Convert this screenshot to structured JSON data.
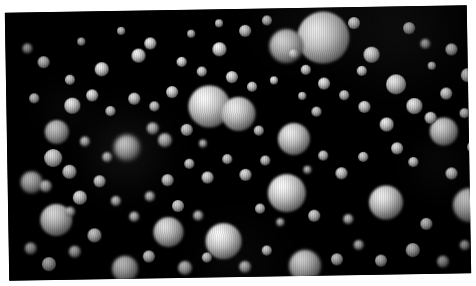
{
  "meta": {
    "domain": "Natural-Image"
  },
  "canvas": {
    "width": 476,
    "height": 286,
    "page_background": "#ffffff",
    "plate_background": "#000000",
    "plate_rotation_deg": -0.95,
    "plate_width": 462,
    "plate_height": 268
  },
  "palette": {
    "background": "#000000",
    "page": "#ffffff",
    "sphere_highlight": "#ffffff",
    "sphere_midtone": "#d9d9d9",
    "sphere_shadow": "#3a3a3a",
    "sphere_terminator": "#141414",
    "haze": "#4a4a4a"
  },
  "lighting": {
    "highlight_x_pct": 36,
    "highlight_y_pct": 30,
    "model": "radial-gradient"
  },
  "glows": [
    {
      "x": 118,
      "y": 140,
      "r": 46,
      "a": 0.17
    },
    {
      "x": 392,
      "y": 14,
      "r": 72,
      "a": 0.16
    },
    {
      "x": 300,
      "y": 6,
      "r": 52,
      "a": 0.1
    },
    {
      "x": 230,
      "y": 250,
      "r": 46,
      "a": 0.08
    },
    {
      "x": 58,
      "y": 96,
      "r": 30,
      "a": 0.07
    },
    {
      "x": 430,
      "y": 160,
      "r": 34,
      "a": 0.07
    }
  ],
  "spheres": [
    {
      "x": 318,
      "y": 30,
      "r": 26,
      "b": 0.3,
      "i": 1.0
    },
    {
      "x": 281,
      "y": 38,
      "r": 17,
      "b": 0.8,
      "i": 0.85
    },
    {
      "x": 203,
      "y": 97,
      "r": 21,
      "b": 0.4,
      "i": 1.0
    },
    {
      "x": 232,
      "y": 105,
      "r": 17,
      "b": 0.5,
      "i": 0.95
    },
    {
      "x": 287,
      "y": 131,
      "r": 16,
      "b": 0.6,
      "i": 0.95
    },
    {
      "x": 279,
      "y": 185,
      "r": 19,
      "b": 0.4,
      "i": 1.0
    },
    {
      "x": 215,
      "y": 232,
      "r": 18,
      "b": 0.5,
      "i": 1.0
    },
    {
      "x": 160,
      "y": 222,
      "r": 15,
      "b": 0.7,
      "i": 0.9
    },
    {
      "x": 378,
      "y": 196,
      "r": 17,
      "b": 0.5,
      "i": 0.95
    },
    {
      "x": 48,
      "y": 208,
      "r": 16,
      "b": 0.6,
      "i": 0.95
    },
    {
      "x": 50,
      "y": 120,
      "r": 12,
      "b": 0.9,
      "i": 0.8
    },
    {
      "x": 120,
      "y": 137,
      "r": 13,
      "b": 1.2,
      "i": 0.8
    },
    {
      "x": 296,
      "y": 258,
      "r": 16,
      "b": 0.8,
      "i": 0.9
    },
    {
      "x": 116,
      "y": 258,
      "r": 13,
      "b": 1.0,
      "i": 0.85
    },
    {
      "x": 437,
      "y": 126,
      "r": 14,
      "b": 0.7,
      "i": 0.9
    },
    {
      "x": 462,
      "y": 200,
      "r": 17,
      "b": 0.8,
      "i": 0.9
    },
    {
      "x": 390,
      "y": 78,
      "r": 10,
      "b": 0.6,
      "i": 0.95
    },
    {
      "x": 24,
      "y": 170,
      "r": 11,
      "b": 1.1,
      "i": 0.8
    },
    {
      "x": 66,
      "y": 94,
      "r": 8,
      "b": 0.6,
      "i": 0.95
    },
    {
      "x": 96,
      "y": 58,
      "r": 7,
      "b": 0.5,
      "i": 1.0
    },
    {
      "x": 133,
      "y": 45,
      "r": 7,
      "b": 0.5,
      "i": 1.0
    },
    {
      "x": 145,
      "y": 33,
      "r": 6,
      "b": 0.5,
      "i": 1.0
    },
    {
      "x": 176,
      "y": 52,
      "r": 5,
      "b": 0.6,
      "i": 0.95
    },
    {
      "x": 214,
      "y": 40,
      "r": 7,
      "b": 0.5,
      "i": 1.0
    },
    {
      "x": 240,
      "y": 22,
      "r": 6,
      "b": 0.7,
      "i": 0.9
    },
    {
      "x": 262,
      "y": 12,
      "r": 5,
      "b": 0.8,
      "i": 0.85
    },
    {
      "x": 349,
      "y": 16,
      "r": 6,
      "b": 0.6,
      "i": 0.95
    },
    {
      "x": 366,
      "y": 48,
      "r": 8,
      "b": 0.6,
      "i": 0.95
    },
    {
      "x": 404,
      "y": 22,
      "r": 6,
      "b": 0.8,
      "i": 0.85
    },
    {
      "x": 420,
      "y": 38,
      "r": 5,
      "b": 0.9,
      "i": 0.8
    },
    {
      "x": 446,
      "y": 44,
      "r": 6,
      "b": 0.7,
      "i": 0.9
    },
    {
      "x": 462,
      "y": 70,
      "r": 7,
      "b": 0.7,
      "i": 0.9
    },
    {
      "x": 440,
      "y": 88,
      "r": 6,
      "b": 0.6,
      "i": 0.95
    },
    {
      "x": 408,
      "y": 100,
      "r": 8,
      "b": 0.6,
      "i": 0.95
    },
    {
      "x": 424,
      "y": 112,
      "r": 6,
      "b": 0.7,
      "i": 0.9
    },
    {
      "x": 380,
      "y": 118,
      "r": 7,
      "b": 0.6,
      "i": 0.95
    },
    {
      "x": 358,
      "y": 100,
      "r": 6,
      "b": 0.7,
      "i": 0.9
    },
    {
      "x": 338,
      "y": 88,
      "r": 5,
      "b": 0.8,
      "i": 0.85
    },
    {
      "x": 318,
      "y": 76,
      "r": 6,
      "b": 0.6,
      "i": 0.95
    },
    {
      "x": 300,
      "y": 62,
      "r": 5,
      "b": 0.7,
      "i": 0.9
    },
    {
      "x": 268,
      "y": 72,
      "r": 4,
      "b": 0.6,
      "i": 0.95
    },
    {
      "x": 246,
      "y": 78,
      "r": 5,
      "b": 0.7,
      "i": 0.9
    },
    {
      "x": 226,
      "y": 68,
      "r": 6,
      "b": 0.6,
      "i": 0.95
    },
    {
      "x": 196,
      "y": 62,
      "r": 5,
      "b": 0.7,
      "i": 0.9
    },
    {
      "x": 166,
      "y": 82,
      "r": 6,
      "b": 0.6,
      "i": 0.95
    },
    {
      "x": 148,
      "y": 96,
      "r": 5,
      "b": 0.8,
      "i": 0.85
    },
    {
      "x": 128,
      "y": 88,
      "r": 6,
      "b": 0.7,
      "i": 0.9
    },
    {
      "x": 104,
      "y": 100,
      "r": 5,
      "b": 0.8,
      "i": 0.85
    },
    {
      "x": 86,
      "y": 84,
      "r": 6,
      "b": 0.6,
      "i": 0.95
    },
    {
      "x": 64,
      "y": 68,
      "r": 5,
      "b": 0.7,
      "i": 0.9
    },
    {
      "x": 38,
      "y": 50,
      "r": 6,
      "b": 0.7,
      "i": 0.9
    },
    {
      "x": 22,
      "y": 36,
      "r": 5,
      "b": 0.9,
      "i": 0.8
    },
    {
      "x": 28,
      "y": 86,
      "r": 5,
      "b": 0.8,
      "i": 0.85
    },
    {
      "x": 46,
      "y": 146,
      "r": 9,
      "b": 0.7,
      "i": 0.9
    },
    {
      "x": 62,
      "y": 160,
      "r": 7,
      "b": 0.8,
      "i": 0.85
    },
    {
      "x": 38,
      "y": 174,
      "r": 6,
      "b": 0.9,
      "i": 0.8
    },
    {
      "x": 72,
      "y": 186,
      "r": 7,
      "b": 0.7,
      "i": 0.9
    },
    {
      "x": 92,
      "y": 170,
      "r": 6,
      "b": 0.8,
      "i": 0.85
    },
    {
      "x": 108,
      "y": 190,
      "r": 5,
      "b": 0.9,
      "i": 0.8
    },
    {
      "x": 86,
      "y": 224,
      "r": 7,
      "b": 0.8,
      "i": 0.85
    },
    {
      "x": 66,
      "y": 240,
      "r": 6,
      "b": 0.9,
      "i": 0.8
    },
    {
      "x": 40,
      "y": 252,
      "r": 7,
      "b": 0.8,
      "i": 0.85
    },
    {
      "x": 22,
      "y": 236,
      "r": 6,
      "b": 1.0,
      "i": 0.8
    },
    {
      "x": 140,
      "y": 246,
      "r": 6,
      "b": 0.8,
      "i": 0.85
    },
    {
      "x": 176,
      "y": 258,
      "r": 7,
      "b": 0.9,
      "i": 0.8
    },
    {
      "x": 198,
      "y": 248,
      "r": 5,
      "b": 0.8,
      "i": 0.85
    },
    {
      "x": 236,
      "y": 258,
      "r": 6,
      "b": 0.9,
      "i": 0.8
    },
    {
      "x": 258,
      "y": 242,
      "r": 5,
      "b": 0.8,
      "i": 0.85
    },
    {
      "x": 328,
      "y": 252,
      "r": 6,
      "b": 0.8,
      "i": 0.85
    },
    {
      "x": 350,
      "y": 238,
      "r": 5,
      "b": 0.9,
      "i": 0.8
    },
    {
      "x": 372,
      "y": 254,
      "r": 6,
      "b": 0.8,
      "i": 0.85
    },
    {
      "x": 404,
      "y": 244,
      "r": 7,
      "b": 0.8,
      "i": 0.85
    },
    {
      "x": 434,
      "y": 256,
      "r": 6,
      "b": 0.9,
      "i": 0.8
    },
    {
      "x": 456,
      "y": 240,
      "r": 5,
      "b": 1.0,
      "i": 0.8
    },
    {
      "x": 418,
      "y": 218,
      "r": 6,
      "b": 0.8,
      "i": 0.85
    },
    {
      "x": 444,
      "y": 168,
      "r": 6,
      "b": 0.7,
      "i": 0.9
    },
    {
      "x": 406,
      "y": 156,
      "r": 5,
      "b": 0.8,
      "i": 0.85
    },
    {
      "x": 390,
      "y": 142,
      "r": 6,
      "b": 0.7,
      "i": 0.9
    },
    {
      "x": 356,
      "y": 150,
      "r": 5,
      "b": 0.8,
      "i": 0.85
    },
    {
      "x": 334,
      "y": 166,
      "r": 6,
      "b": 0.7,
      "i": 0.9
    },
    {
      "x": 316,
      "y": 148,
      "r": 5,
      "b": 0.8,
      "i": 0.85
    },
    {
      "x": 300,
      "y": 162,
      "r": 4,
      "b": 0.9,
      "i": 0.8
    },
    {
      "x": 258,
      "y": 152,
      "r": 5,
      "b": 0.8,
      "i": 0.85
    },
    {
      "x": 238,
      "y": 166,
      "r": 6,
      "b": 0.7,
      "i": 0.9
    },
    {
      "x": 220,
      "y": 150,
      "r": 5,
      "b": 0.8,
      "i": 0.85
    },
    {
      "x": 200,
      "y": 168,
      "r": 6,
      "b": 0.7,
      "i": 0.9
    },
    {
      "x": 182,
      "y": 154,
      "r": 5,
      "b": 0.8,
      "i": 0.85
    },
    {
      "x": 160,
      "y": 170,
      "r": 6,
      "b": 0.8,
      "i": 0.85
    },
    {
      "x": 142,
      "y": 186,
      "r": 5,
      "b": 0.9,
      "i": 0.8
    },
    {
      "x": 170,
      "y": 196,
      "r": 6,
      "b": 0.8,
      "i": 0.85
    },
    {
      "x": 190,
      "y": 206,
      "r": 5,
      "b": 0.9,
      "i": 0.8
    },
    {
      "x": 126,
      "y": 206,
      "r": 5,
      "b": 0.9,
      "i": 0.8
    },
    {
      "x": 252,
      "y": 200,
      "r": 5,
      "b": 0.8,
      "i": 0.85
    },
    {
      "x": 272,
      "y": 214,
      "r": 4,
      "b": 0.9,
      "i": 0.8
    },
    {
      "x": 306,
      "y": 208,
      "r": 6,
      "b": 0.8,
      "i": 0.85
    },
    {
      "x": 340,
      "y": 212,
      "r": 5,
      "b": 0.9,
      "i": 0.8
    },
    {
      "x": 458,
      "y": 108,
      "r": 5,
      "b": 0.8,
      "i": 0.85
    },
    {
      "x": 466,
      "y": 142,
      "r": 6,
      "b": 0.8,
      "i": 0.85
    },
    {
      "x": 356,
      "y": 64,
      "r": 5,
      "b": 0.7,
      "i": 0.9
    },
    {
      "x": 252,
      "y": 122,
      "r": 5,
      "b": 0.8,
      "i": 0.85
    },
    {
      "x": 180,
      "y": 120,
      "r": 6,
      "b": 0.8,
      "i": 0.85
    },
    {
      "x": 158,
      "y": 130,
      "r": 7,
      "b": 0.9,
      "i": 0.8
    },
    {
      "x": 146,
      "y": 118,
      "r": 6,
      "b": 0.9,
      "i": 0.8
    },
    {
      "x": 100,
      "y": 146,
      "r": 5,
      "b": 1.0,
      "i": 0.8
    },
    {
      "x": 78,
      "y": 130,
      "r": 5,
      "b": 0.9,
      "i": 0.8
    },
    {
      "x": 214,
      "y": 14,
      "r": 4,
      "b": 0.7,
      "i": 0.9
    },
    {
      "x": 186,
      "y": 24,
      "r": 4,
      "b": 0.8,
      "i": 0.85
    },
    {
      "x": 116,
      "y": 20,
      "r": 4,
      "b": 0.7,
      "i": 0.9
    },
    {
      "x": 76,
      "y": 30,
      "r": 4,
      "b": 0.8,
      "i": 0.85
    },
    {
      "x": 310,
      "y": 104,
      "r": 5,
      "b": 0.8,
      "i": 0.85
    },
    {
      "x": 426,
      "y": 60,
      "r": 4,
      "b": 0.8,
      "i": 0.85
    },
    {
      "x": 296,
      "y": 88,
      "r": 4,
      "b": 0.8,
      "i": 0.85
    },
    {
      "x": 196,
      "y": 134,
      "r": 4,
      "b": 0.9,
      "i": 0.8
    },
    {
      "x": 62,
      "y": 200,
      "r": 5,
      "b": 0.9,
      "i": 0.8
    },
    {
      "x": 288,
      "y": 46,
      "r": 5,
      "b": 0.8,
      "i": 0.85
    }
  ]
}
